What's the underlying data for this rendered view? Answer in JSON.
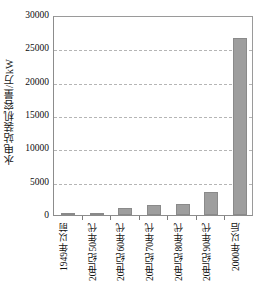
{
  "chart_data": {
    "type": "bar",
    "title": "",
    "subtitle": "",
    "xlabel": "",
    "ylabel": "水电站装机容量/万kW",
    "categories": [
      "1949年以前",
      "20世纪50年代",
      "20世纪60年代",
      "20世纪70年代",
      "20世纪80年代",
      "20世纪90年代",
      "2000年以后"
    ],
    "values": [
      50,
      300,
      1000,
      1500,
      1700,
      3500,
      26500
    ],
    "ylim": [
      0,
      30000
    ],
    "ytick_labels": [
      "0",
      "5000",
      "10000",
      "15000",
      "20000",
      "25000",
      "30000"
    ],
    "ytick_values": [
      0,
      5000,
      10000,
      15000,
      20000,
      25000,
      30000
    ],
    "grid": "horizontal-dashed",
    "legend": "none",
    "bar_color": "#9e9e9e",
    "bar_edge_color": "#8a8a8a",
    "grid_color": "#b5b5b5",
    "axis_color": "#8c8c8c",
    "background": "#ffffff"
  }
}
